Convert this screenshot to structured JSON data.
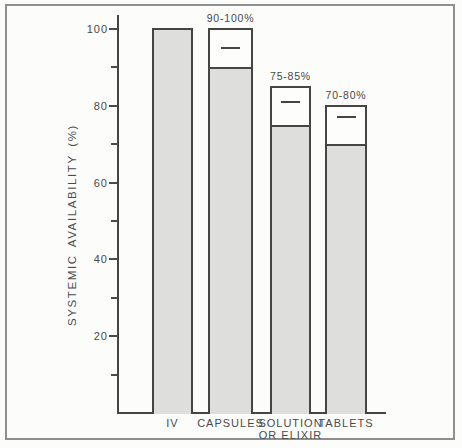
{
  "figure": {
    "title": "",
    "note": ""
  },
  "chart_data": {
    "type": "bar",
    "title": "",
    "xlabel": "",
    "ylabel": "SYSTEMIC AVAILABILITY (%)",
    "ylim": [
      0,
      100
    ],
    "y_major_ticks": [
      20,
      40,
      60,
      80,
      100
    ],
    "y_minor_ticks": [
      10,
      30,
      50,
      70,
      90
    ],
    "grid": false,
    "legend": false,
    "categories": [
      "IV",
      "CAPSULES",
      "SOLUTION OR ELIXIR",
      "TABLETS"
    ],
    "category_label_lines": [
      [
        "IV"
      ],
      [
        "CAPSULES"
      ],
      [
        "SOLUTION",
        "OR ELIXIR"
      ],
      [
        "TABLETS"
      ]
    ],
    "bars": [
      {
        "category": "IV",
        "value_low": 100,
        "value_high": 100,
        "range_label": null,
        "mean_tick": null
      },
      {
        "category": "CAPSULES",
        "value_low": 90,
        "value_high": 100,
        "range_label": "90-100%",
        "mean_tick": 95
      },
      {
        "category": "SOLUTION OR ELIXIR",
        "value_low": 75,
        "value_high": 85,
        "range_label": "75-85%",
        "mean_tick": 81
      },
      {
        "category": "TABLETS",
        "value_low": 70,
        "value_high": 80,
        "range_label": "70-80%",
        "mean_tick": 77
      }
    ],
    "bar_semantics": "shaded region = lower bound of systemic availability, open region extends to upper bound, inner dash = mean estimate"
  },
  "colors": {
    "bar_fill": "#dededc",
    "bar_border": "#454545",
    "open_fill": "#fdfdfc",
    "axis": "#454545",
    "text": "#4a4a4a",
    "frame_border": "#8f8f8f",
    "background": "#fcfcfb"
  }
}
